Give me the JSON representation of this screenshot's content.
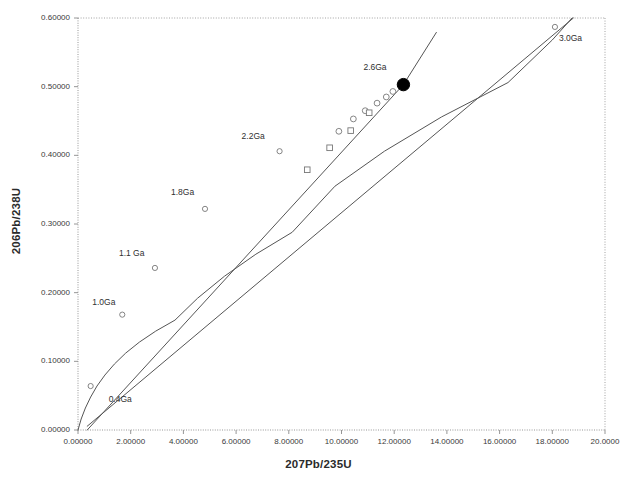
{
  "chart_data": {
    "type": "scatter",
    "title": "",
    "xlabel": "207Pb/235U",
    "ylabel": "206Pb/238U",
    "xlim": [
      0,
      20
    ],
    "ylim": [
      0,
      0.6
    ],
    "grid": false,
    "legend": null,
    "xticks": [
      {
        "value": 0,
        "label": "0.00000"
      },
      {
        "value": 2,
        "label": "2.00000"
      },
      {
        "value": 4,
        "label": "4.00000"
      },
      {
        "value": 6,
        "label": "6.00000"
      },
      {
        "value": 8,
        "label": "8.00000"
      },
      {
        "value": 10,
        "label": "10.00000"
      },
      {
        "value": 12,
        "label": "12.00000"
      },
      {
        "value": 14,
        "label": "14.00000"
      },
      {
        "value": 16,
        "label": "16.00000"
      },
      {
        "value": 18,
        "label": "18.00000"
      },
      {
        "value": 20,
        "label": "20.0000"
      }
    ],
    "yticks": [
      {
        "value": 0.0,
        "label": "0.00000"
      },
      {
        "value": 0.1,
        "label": "0.10000"
      },
      {
        "value": 0.2,
        "label": "0.20000"
      },
      {
        "value": 0.3,
        "label": "0.30000"
      },
      {
        "value": 0.4,
        "label": "0.40000"
      },
      {
        "value": 0.5,
        "label": "0.50000"
      },
      {
        "value": 0.6,
        "label": "0.60000"
      }
    ],
    "series": [
      {
        "name": "concordia-curve",
        "type": "line",
        "x": [
          0.0,
          0.12,
          0.28,
          0.48,
          0.72,
          1.02,
          1.38,
          1.81,
          2.33,
          2.95,
          3.68,
          4.54,
          5.56,
          6.75,
          8.13,
          9.75,
          11.63,
          13.8,
          16.32,
          18.0,
          18.75
        ],
        "y": [
          0.0,
          0.016,
          0.032,
          0.048,
          0.064,
          0.08,
          0.096,
          0.112,
          0.128,
          0.144,
          0.16,
          0.192,
          0.224,
          0.256,
          0.288,
          0.355,
          0.406,
          0.456,
          0.506,
          0.568,
          0.6
        ]
      },
      {
        "name": "discordia-line",
        "type": "line",
        "x": [
          0.35,
          12.35,
          13.6
        ],
        "y": [
          0.0,
          0.503,
          0.579
        ]
      },
      {
        "name": "lower-regression-line",
        "type": "line",
        "x": [
          0.35,
          18.8
        ],
        "y": [
          0.0055,
          0.6
        ]
      }
    ],
    "age_markers": [
      {
        "label": "0.4Ga",
        "x": 0.48,
        "y": 0.064,
        "label_dx": 18,
        "label_dy": 14
      },
      {
        "label": "1.0Ga",
        "x": 1.68,
        "y": 0.168,
        "label_dx": -30,
        "label_dy": -12
      },
      {
        "label": "1.1 Ga",
        "x": 2.92,
        "y": 0.236,
        "label_dx": -36,
        "label_dy": -14
      },
      {
        "label": "1.8Ga",
        "x": 4.82,
        "y": 0.322,
        "label_dx": -34,
        "label_dy": -16
      },
      {
        "label": "2.2Ga",
        "x": 7.65,
        "y": 0.406,
        "label_dx": -38,
        "label_dy": -14
      },
      {
        "label": "2.6Ga",
        "x": 12.35,
        "y": 0.503,
        "label_dx": -40,
        "label_dy": -17
      },
      {
        "label": "3.0Ga",
        "x": 18.1,
        "y": 0.587,
        "label_dx": 4,
        "label_dy": 12
      }
    ],
    "data_points": [
      {
        "marker": "circle-open",
        "x": 9.9,
        "y": 0.435
      },
      {
        "marker": "circle-open",
        "x": 10.45,
        "y": 0.453
      },
      {
        "marker": "circle-open",
        "x": 10.9,
        "y": 0.465
      },
      {
        "marker": "circle-open",
        "x": 11.35,
        "y": 0.476
      },
      {
        "marker": "circle-open",
        "x": 11.7,
        "y": 0.485
      },
      {
        "marker": "circle-open",
        "x": 11.95,
        "y": 0.493
      },
      {
        "marker": "square-open",
        "x": 8.7,
        "y": 0.379
      },
      {
        "marker": "square-open",
        "x": 9.55,
        "y": 0.411
      },
      {
        "marker": "square-open",
        "x": 10.35,
        "y": 0.436
      },
      {
        "marker": "square-open",
        "x": 11.05,
        "y": 0.462
      },
      {
        "marker": "circle-filled",
        "x": 12.35,
        "y": 0.503
      }
    ],
    "colors": {
      "curve": "#555555",
      "line": "#555555",
      "marker_edge": "#777777",
      "marker_filled": "#000000",
      "axis": "#8a8a8a",
      "text": "#2f2f2f"
    }
  }
}
